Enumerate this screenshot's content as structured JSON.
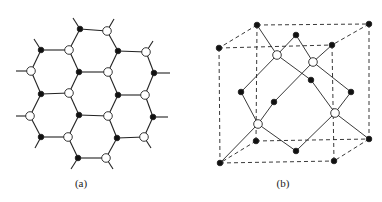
{
  "colors": {
    "line": "#222222",
    "filled": "#111111",
    "open_fill": "#ffffff",
    "background": "#ffffff"
  },
  "panel_a": {
    "label": "(a)",
    "description": "Honeycomb lattice with two sublattices",
    "atoms": [
      {
        "x": 80,
        "y": 29,
        "type": "filled"
      },
      {
        "x": 107,
        "y": 31,
        "type": "open"
      },
      {
        "x": 41,
        "y": 50,
        "type": "filled"
      },
      {
        "x": 69,
        "y": 50,
        "type": "open"
      },
      {
        "x": 118,
        "y": 51,
        "type": "filled"
      },
      {
        "x": 146,
        "y": 52,
        "type": "open"
      },
      {
        "x": 31,
        "y": 71,
        "type": "open"
      },
      {
        "x": 79,
        "y": 72,
        "type": "filled"
      },
      {
        "x": 108,
        "y": 72,
        "type": "open"
      },
      {
        "x": 154,
        "y": 73,
        "type": "filled"
      },
      {
        "x": 41,
        "y": 94,
        "type": "filled"
      },
      {
        "x": 69,
        "y": 93,
        "type": "open"
      },
      {
        "x": 118,
        "y": 95,
        "type": "filled"
      },
      {
        "x": 145,
        "y": 95,
        "type": "open"
      },
      {
        "x": 30,
        "y": 116,
        "type": "open"
      },
      {
        "x": 79,
        "y": 115,
        "type": "filled"
      },
      {
        "x": 108,
        "y": 116,
        "type": "open"
      },
      {
        "x": 153,
        "y": 117,
        "type": "filled"
      },
      {
        "x": 41,
        "y": 137,
        "type": "filled"
      },
      {
        "x": 68,
        "y": 137,
        "type": "open"
      },
      {
        "x": 117,
        "y": 138,
        "type": "filled"
      },
      {
        "x": 144,
        "y": 137,
        "type": "open"
      },
      {
        "x": 78,
        "y": 158,
        "type": "filled"
      },
      {
        "x": 106,
        "y": 158,
        "type": "open"
      }
    ]
  },
  "panel_b": {
    "label": "(b)",
    "description": "Zinc-blende / diamond cubic unit cell",
    "atoms": [
      {
        "x": 257,
        "y": 25,
        "type": "filled"
      },
      {
        "x": 369,
        "y": 24,
        "type": "filled"
      },
      {
        "x": 219,
        "y": 48,
        "type": "filled"
      },
      {
        "x": 332,
        "y": 45,
        "type": "filled"
      },
      {
        "x": 296,
        "y": 35,
        "type": "filled"
      },
      {
        "x": 277,
        "y": 55,
        "type": "open"
      },
      {
        "x": 313,
        "y": 62,
        "type": "open"
      },
      {
        "x": 311,
        "y": 80,
        "type": "filled"
      },
      {
        "x": 241,
        "y": 92,
        "type": "filled"
      },
      {
        "x": 351,
        "y": 92,
        "type": "filled"
      },
      {
        "x": 274,
        "y": 102,
        "type": "filled"
      },
      {
        "x": 258,
        "y": 124,
        "type": "open"
      },
      {
        "x": 335,
        "y": 113,
        "type": "open"
      },
      {
        "x": 256,
        "y": 141,
        "type": "filled"
      },
      {
        "x": 369,
        "y": 139,
        "type": "filled"
      },
      {
        "x": 296,
        "y": 151,
        "type": "filled"
      },
      {
        "x": 220,
        "y": 163,
        "type": "filled"
      },
      {
        "x": 334,
        "y": 161,
        "type": "filled"
      }
    ]
  }
}
